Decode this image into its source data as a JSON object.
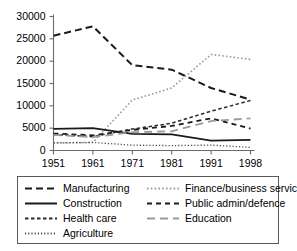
{
  "chart_data": {
    "type": "line",
    "title": "",
    "xlabel": "",
    "ylabel": "",
    "x": [
      "1951",
      "1961",
      "1971",
      "1981",
      "1991",
      "1998"
    ],
    "xtick_labels": [
      "1951",
      "1961",
      "1971",
      "1981",
      "1991",
      "1998"
    ],
    "ytick_labels": [
      "0",
      "5000",
      "10000",
      "15000",
      "20000",
      "25000",
      "30000"
    ],
    "ytick_values": [
      0,
      5000,
      10000,
      15000,
      20000,
      25000,
      30000
    ],
    "ylim": [
      0,
      30000
    ],
    "grid": false,
    "legend_position": "below-plot",
    "series": [
      {
        "name": "Manufacturing",
        "style": "long-dash",
        "color": "#1a1a1a",
        "width": 2.0,
        "values": [
          25700,
          27800,
          19100,
          18100,
          14000,
          11400
        ]
      },
      {
        "name": "Finance/business services",
        "style": "dotted",
        "color": "#9a9a9a",
        "width": 1.6,
        "values": [
          1700,
          1800,
          11300,
          14000,
          21500,
          20400
        ]
      },
      {
        "name": "Construction",
        "style": "solid",
        "color": "#1a1a1a",
        "width": 1.8,
        "values": [
          4850,
          5000,
          3700,
          3600,
          2200,
          2400
        ]
      },
      {
        "name": "Public admin/defence",
        "style": "medium-dash",
        "color": "#1a1a1a",
        "width": 1.8,
        "values": [
          3800,
          3400,
          4600,
          5500,
          7200,
          4900
        ]
      },
      {
        "name": "Health care",
        "style": "short-dash",
        "color": "#2a2a2a",
        "width": 1.5,
        "values": [
          3600,
          3100,
          4800,
          6100,
          8800,
          11200
        ]
      },
      {
        "name": "Education",
        "style": "gray-long-dash",
        "color": "#9a9a9a",
        "width": 1.8,
        "values": [
          3500,
          3000,
          4100,
          4300,
          6600,
          7200
        ]
      },
      {
        "name": "Agriculture",
        "style": "fine-dotted",
        "color": "#4a4a4a",
        "width": 1.3,
        "values": [
          1700,
          1800,
          1200,
          1100,
          1200,
          700
        ]
      }
    ]
  },
  "legend": {
    "rows": [
      {
        "left": {
          "label": "Manufacturing",
          "style": "long-dash",
          "color": "#1a1a1a"
        },
        "right": {
          "label": "Finance/business services",
          "style": "dotted",
          "color": "#9a9a9a"
        }
      },
      {
        "left": {
          "label": "Construction",
          "style": "solid",
          "color": "#1a1a1a"
        },
        "right": {
          "label": "Public admin/defence",
          "style": "medium-dash",
          "color": "#1a1a1a"
        }
      },
      {
        "left": {
          "label": "Health care",
          "style": "short-dash",
          "color": "#2a2a2a"
        },
        "right": {
          "label": "Education",
          "style": "gray-long-dash",
          "color": "#9a9a9a"
        }
      },
      {
        "left": {
          "label": "Agriculture",
          "style": "fine-dotted",
          "color": "#4a4a4a"
        },
        "right": null
      }
    ]
  },
  "axis": {
    "line_color": "#6b6b6b",
    "tick_color": "#6b6b6b"
  }
}
